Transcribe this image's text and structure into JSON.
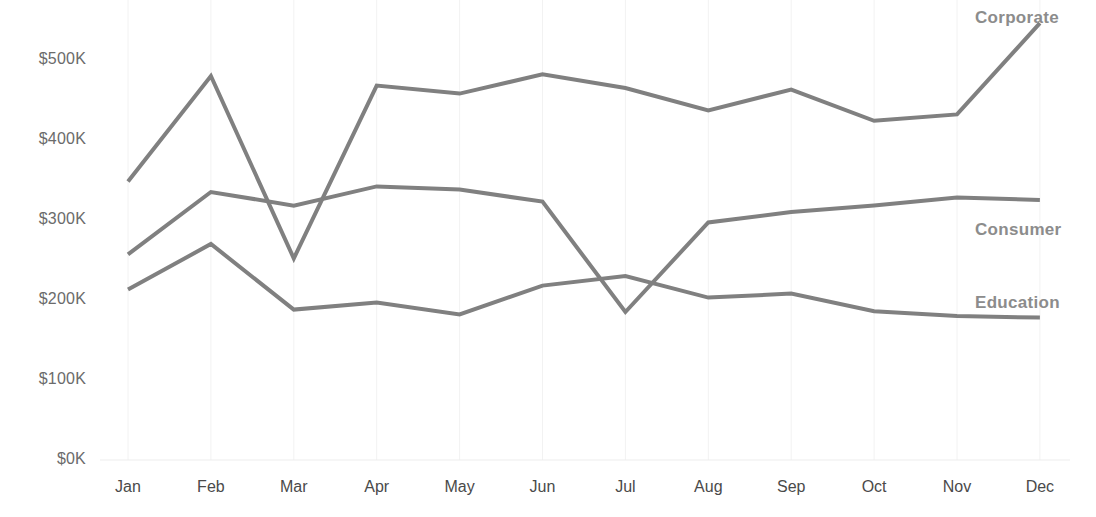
{
  "chart_data": {
    "type": "line",
    "title": "",
    "subtitle": "",
    "xlabel": "",
    "ylabel": "",
    "categories": [
      "Jan",
      "Feb",
      "Mar",
      "Apr",
      "May",
      "Jun",
      "Jul",
      "Aug",
      "Sep",
      "Oct",
      "Nov",
      "Dec"
    ],
    "y_tick_labels": [
      "$500K",
      "$400K",
      "$300K",
      "$200K",
      "$100K",
      "$0K"
    ],
    "y_tick_values": [
      500000,
      400000,
      300000,
      200000,
      100000,
      0
    ],
    "ylim": [
      0,
      500000
    ],
    "y_unit": "USD",
    "grid": true,
    "legend_position": "right-inline-labels",
    "series": [
      {
        "name": "Corporate",
        "color": "#808080",
        "values": [
          348000,
          480000,
          252000,
          468000,
          458000,
          482000,
          465000,
          437000,
          463000,
          424000,
          432000,
          546000
        ]
      },
      {
        "name": "Consumer",
        "color": "#808080",
        "values": [
          257000,
          335000,
          318000,
          342000,
          338000,
          323000,
          185000,
          297000,
          310000,
          318000,
          328000,
          325000
        ]
      },
      {
        "name": "Education",
        "color": "#808080",
        "values": [
          213000,
          270000,
          188000,
          197000,
          182000,
          218000,
          230000,
          203000,
          208000,
          186000,
          180000,
          178000
        ]
      }
    ]
  },
  "axis": {
    "x_label_color": "#4a4a4a",
    "y_label_color": "#6b6b6b",
    "gridline_color": "#f2f2f2"
  },
  "series_labels": [
    {
      "text": "Corporate"
    },
    {
      "text": "Consumer"
    },
    {
      "text": "Education"
    }
  ]
}
